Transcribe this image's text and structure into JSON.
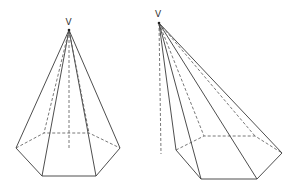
{
  "figures": [
    {
      "name": "right-hexagonal-pyramid",
      "apex_label": "V",
      "apex": [
        69,
        30
      ],
      "base_front": [
        [
          16,
          148
        ],
        [
          42,
          176
        ],
        [
          96,
          176
        ],
        [
          120,
          148
        ]
      ],
      "base_back": [
        [
          44,
          133
        ],
        [
          89,
          133
        ]
      ],
      "axis_foot": [
        69,
        150
      ]
    },
    {
      "name": "oblique-hexagonal-pyramid",
      "apex_label": "V",
      "apex": [
        159,
        23
      ],
      "base_front": [
        [
          176,
          150
        ],
        [
          201,
          179
        ],
        [
          257,
          179
        ],
        [
          282,
          153
        ]
      ],
      "base_back": [
        [
          204,
          136
        ],
        [
          255,
          136
        ]
      ],
      "axis_foot": [
        161,
        154
      ]
    }
  ],
  "colors": {
    "line": "#3a3a3a",
    "background": "#ffffff"
  }
}
